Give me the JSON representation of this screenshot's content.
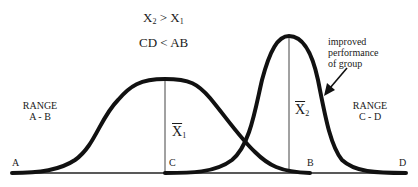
{
  "header": {
    "inequality_means": {
      "left_var": "X",
      "left_sub": "2",
      "op": ">",
      "right_var": "X",
      "right_sub": "1"
    },
    "inequality_ranges": "CD  <  AB"
  },
  "annotation": {
    "line1": "improved",
    "line2": "performance",
    "line3": "of group"
  },
  "ranges": {
    "left": {
      "title": "RANGE",
      "span": "A - B"
    },
    "right": {
      "title": "RANGE",
      "span": "C - D"
    }
  },
  "points": {
    "a": "A",
    "b": "B",
    "c": "C",
    "d": "D"
  },
  "means": {
    "x1": {
      "var": "X",
      "sub": "1"
    },
    "x2": {
      "var": "X",
      "sub": "2"
    }
  },
  "colors": {
    "curve": "#111111",
    "line": "#333333",
    "background": "#ffffff"
  }
}
